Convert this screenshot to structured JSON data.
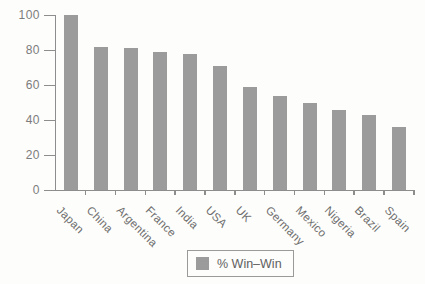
{
  "chart_data": {
    "type": "bar",
    "title": "",
    "xlabel": "",
    "ylabel": "",
    "categories": [
      "Japan",
      "China",
      "Argentina",
      "France",
      "India",
      "USA",
      "UK",
      "Germany",
      "Mexico",
      "Nigeria",
      "Brazil",
      "Spain"
    ],
    "values": [
      100,
      82,
      81,
      79,
      78,
      71,
      59,
      54,
      50,
      46,
      43,
      36
    ],
    "ylim": [
      0,
      100
    ],
    "yticks": [
      0,
      20,
      40,
      60,
      80,
      100
    ],
    "grid": false,
    "legend": {
      "label": "% Win–Win",
      "position": "bottom"
    },
    "bar_color": "#9b9b9b",
    "axis_color": "#8d8d8d",
    "tick_label_color": "#7c7c7c",
    "category_label_color": "#6e6e6e",
    "background_color": "#fdfdfb"
  }
}
